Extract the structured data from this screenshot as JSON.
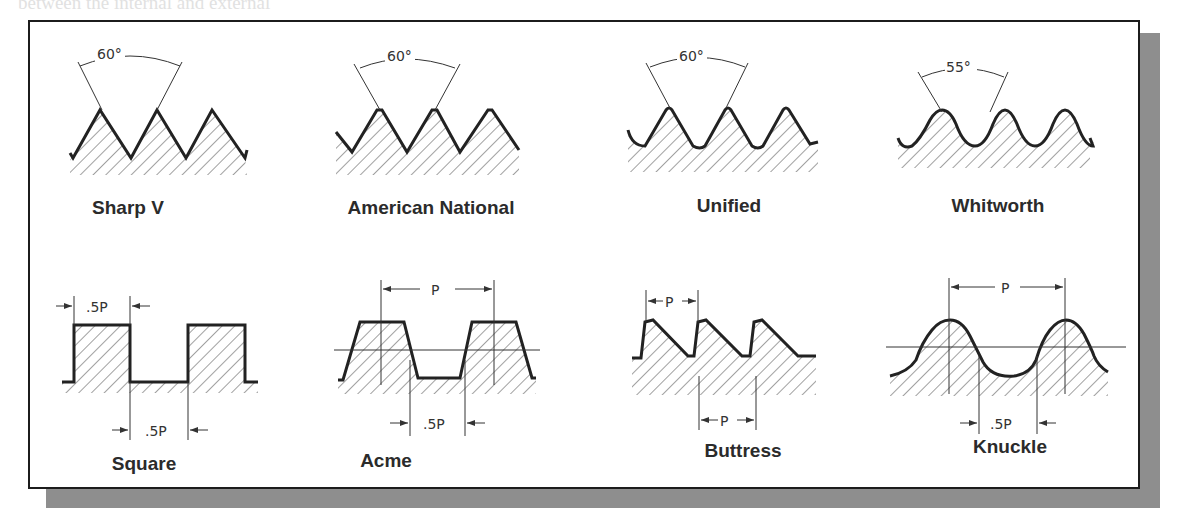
{
  "figure": {
    "frame_color": "#1c1c1c",
    "shadow_color": "#8e8e8e",
    "line_color": "#2a2a2a",
    "background_text_lines": [
      "between the internal and external",
      "the Sharp V thread is especially ...",
      "used in ... nuts and ... the threads ... be ... in ...",
      "internal threads ... produced by ... while external threads by ..."
    ],
    "top_row": [
      {
        "name": "Sharp V",
        "angle": "60°",
        "profile": "sharp-v"
      },
      {
        "name": "American National",
        "angle": "60°",
        "profile": "flat-crest-v"
      },
      {
        "name": "Unified",
        "angle": "60°",
        "profile": "rounded-root-v"
      },
      {
        "name": "Whitworth",
        "angle": "55°",
        "profile": "rounded-v"
      }
    ],
    "bottom_row": [
      {
        "name": "Square",
        "dims": {
          "top": ".5P",
          "bottom": ".5P"
        },
        "profile": "square"
      },
      {
        "name": "Acme",
        "dims": {
          "top": "P",
          "bottom": ".5P"
        },
        "profile": "trapezoid"
      },
      {
        "name": "Buttress",
        "dims": {
          "top": "P",
          "bottom": "P"
        },
        "profile": "sawtooth"
      },
      {
        "name": "Knuckle",
        "dims": {
          "top": "P",
          "bottom": ".5P"
        },
        "profile": "rounded"
      }
    ]
  }
}
